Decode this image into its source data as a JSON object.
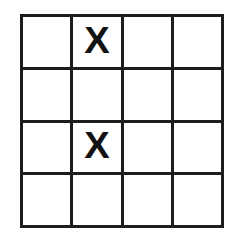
{
  "figure": {
    "kind": "grid-puzzle",
    "title": "",
    "rows": 4,
    "columns": 4,
    "line_color": "#1d1d1d",
    "cell_color": "#ffffff",
    "mark_color": "#121212",
    "background_color": "#ffffff",
    "mark_symbol": "X",
    "cells": [
      [
        {
          "row": 1,
          "column": 1,
          "mark": ""
        },
        {
          "row": 1,
          "column": 2,
          "mark": "X"
        },
        {
          "row": 1,
          "column": 3,
          "mark": ""
        },
        {
          "row": 1,
          "column": 4,
          "mark": ""
        }
      ],
      [
        {
          "row": 2,
          "column": 1,
          "mark": ""
        },
        {
          "row": 2,
          "column": 2,
          "mark": ""
        },
        {
          "row": 2,
          "column": 3,
          "mark": ""
        },
        {
          "row": 2,
          "column": 4,
          "mark": ""
        }
      ],
      [
        {
          "row": 3,
          "column": 1,
          "mark": ""
        },
        {
          "row": 3,
          "column": 2,
          "mark": "X"
        },
        {
          "row": 3,
          "column": 3,
          "mark": ""
        },
        {
          "row": 3,
          "column": 4,
          "mark": ""
        }
      ],
      [
        {
          "row": 4,
          "column": 1,
          "mark": ""
        },
        {
          "row": 4,
          "column": 2,
          "mark": ""
        },
        {
          "row": 4,
          "column": 3,
          "mark": ""
        },
        {
          "row": 4,
          "column": 4,
          "mark": ""
        }
      ]
    ]
  }
}
